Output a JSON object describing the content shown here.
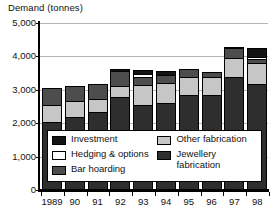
{
  "chart_data": {
    "type": "bar",
    "subtype": "stacked",
    "title": "Demand (tonnes)",
    "xlabel": "",
    "ylabel": "Demand (tonnes)",
    "categories": [
      "1989",
      "90",
      "91",
      "92",
      "93",
      "94",
      "95",
      "96",
      "97",
      "98"
    ],
    "ylim": [
      0,
      5000
    ],
    "yticks": [
      0,
      1000,
      2000,
      3000,
      4000,
      5000
    ],
    "ytick_labels": [
      "0",
      "1,000",
      "2,000",
      "3,000",
      "4,000",
      "5,000"
    ],
    "grid": true,
    "grid_axis": "y",
    "legend_position": "inside-lower-center",
    "series": [
      {
        "name": "Jewellery fabrication",
        "color": "#2e2e2e",
        "values": [
          2000,
          2170,
          2320,
          2750,
          2530,
          2580,
          2800,
          2820,
          3340,
          3150
        ]
      },
      {
        "name": "Other fabrication",
        "color": "#c6c6c6",
        "values": [
          520,
          470,
          380,
          340,
          570,
          600,
          540,
          520,
          590,
          630
        ]
      },
      {
        "name": "Bar hoarding",
        "color": "#4d4d4d",
        "values": [
          500,
          430,
          430,
          440,
          250,
          240,
          260,
          170,
          300,
          100
        ]
      },
      {
        "name": "Hedging & options",
        "color": "#ffffff",
        "values": [
          0,
          0,
          0,
          0,
          90,
          0,
          0,
          0,
          0,
          70
        ]
      },
      {
        "name": "Investment",
        "color": "#141414",
        "values": [
          0,
          0,
          0,
          70,
          110,
          100,
          0,
          0,
          20,
          260
        ]
      }
    ],
    "totals": [
      3020,
      3070,
      3130,
      3600,
      3550,
      3520,
      3600,
      3510,
      4250,
      4210
    ]
  },
  "legend": {
    "entries": [
      {
        "label": "Investment",
        "swatch": "sw-investment"
      },
      {
        "label": "Hedging & options",
        "swatch": "sw-hedging"
      },
      {
        "label": "Bar hoarding",
        "swatch": "sw-bar"
      },
      {
        "label": "Other fabrication",
        "swatch": "sw-other"
      },
      {
        "label": "Jewellery\nfabrication",
        "swatch": "sw-jewellery"
      }
    ]
  }
}
